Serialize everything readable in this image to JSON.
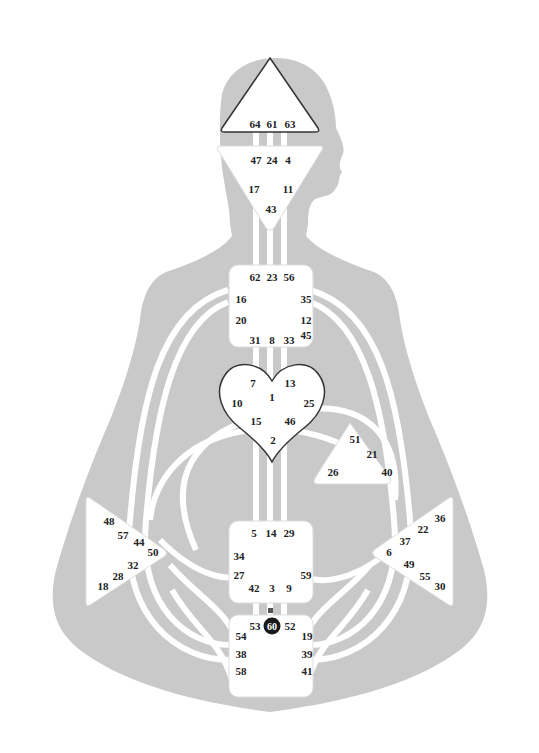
{
  "diagram": {
    "type": "human-design-bodygraph",
    "colors": {
      "body": "#c9c9c9",
      "channel": "#ffffff",
      "center_fill": "#ffffff",
      "center_outline": "#333333",
      "active_gate": "#1a1a1a"
    },
    "centers": {
      "head": {
        "shape": "triangle-up",
        "gates": [
          "64",
          "61",
          "63"
        ]
      },
      "ajna": {
        "shape": "triangle-down",
        "gates": [
          "47",
          "24",
          "4",
          "17",
          "11",
          "43"
        ]
      },
      "throat": {
        "shape": "square",
        "gates": [
          "62",
          "23",
          "56",
          "16",
          "35",
          "20",
          "12",
          "45",
          "31",
          "8",
          "33"
        ]
      },
      "g": {
        "shape": "heart",
        "gates": [
          "7",
          "1",
          "13",
          "10",
          "25",
          "15",
          "46",
          "2"
        ]
      },
      "ego": {
        "shape": "triangle",
        "gates": [
          "51",
          "21",
          "26",
          "40"
        ]
      },
      "spleen": {
        "shape": "triangle-right",
        "gates": [
          "48",
          "57",
          "44",
          "50",
          "32",
          "28",
          "18"
        ]
      },
      "sacral": {
        "shape": "square",
        "gates": [
          "5",
          "14",
          "29",
          "34",
          "27",
          "59",
          "42",
          "3",
          "9"
        ]
      },
      "solar_plexus": {
        "shape": "triangle-left",
        "gates": [
          "36",
          "22",
          "37",
          "6",
          "49",
          "55",
          "30"
        ]
      },
      "root": {
        "shape": "square",
        "gates": [
          "53",
          "60",
          "52",
          "54",
          "19",
          "38",
          "39",
          "58",
          "41"
        ],
        "active_gates": [
          "60"
        ]
      }
    }
  }
}
